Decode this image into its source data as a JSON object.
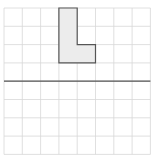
{
  "diagram": {
    "type": "grid-reflection",
    "grid": {
      "columns": 8,
      "rows": 8,
      "cell_size": 18.3,
      "origin_x": 4,
      "origin_y": 8,
      "line_color": "#d8d8d8"
    },
    "mirror_line": {
      "orientation": "horizontal",
      "row_index": 4,
      "color": "#555555"
    },
    "shape": {
      "name": "L-shape",
      "fill": "#ececec",
      "stroke": "#555555",
      "grid_points": [
        [
          3,
          0
        ],
        [
          4,
          0
        ],
        [
          4,
          2
        ],
        [
          5,
          2
        ],
        [
          5,
          3
        ],
        [
          3,
          3
        ]
      ]
    }
  }
}
